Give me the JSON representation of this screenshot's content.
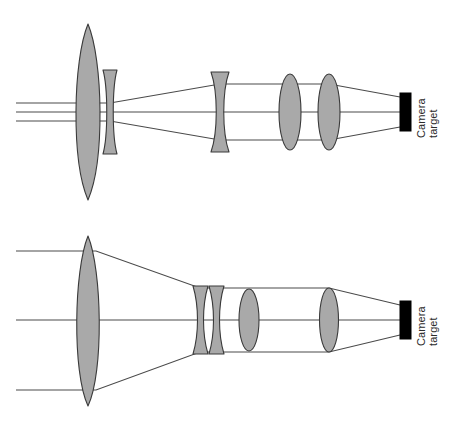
{
  "figure": {
    "background_color": "#ffffff",
    "lens_fill_color": "#a9a9a9",
    "lens_stroke_color": "#3a3a3a",
    "ray_color": "#4a4a4a",
    "sensor_color": "#000000",
    "width": 469,
    "height": 430
  },
  "panels": [
    {
      "id": "top-panel",
      "name": "upper-optical-system",
      "sensor_label_line1": "Camera",
      "sensor_label_line2": "target",
      "axis_y": 112,
      "elements": [
        {
          "name": "objective-lens",
          "type": "biconvex",
          "cx": 88,
          "half_height": 88,
          "thickness": 34
        },
        {
          "name": "field-lens-1",
          "type": "biconcave",
          "cx": 110,
          "half_height": 42,
          "thickness": 13
        },
        {
          "name": "field-lens-2",
          "type": "biconcave",
          "cx": 220,
          "half_height": 40,
          "thickness": 16
        },
        {
          "name": "relay-lens-1",
          "type": "biconvex",
          "cx": 290,
          "half_height": 38,
          "thickness": 20
        },
        {
          "name": "relay-lens-2",
          "type": "biconvex",
          "cx": 329,
          "half_height": 38,
          "thickness": 20
        },
        {
          "name": "camera-target",
          "type": "sensor",
          "x": 400,
          "y": 93,
          "width": 11,
          "height": 38
        }
      ],
      "rays": [
        {
          "name": "ray-upper",
          "points": "16,103 110,103 220,84 290,84 329,84 400,97"
        },
        {
          "name": "ray-axial",
          "points": "16,112 400,112"
        },
        {
          "name": "ray-lower",
          "points": "16,121 110,121 220,140 290,140 329,140 400,127"
        }
      ]
    },
    {
      "id": "bottom-panel",
      "name": "lower-optical-system",
      "sensor_label_line1": "Camera",
      "sensor_label_line2": "target",
      "axis_y": 320,
      "elements": [
        {
          "name": "objective-lens",
          "type": "biconvex",
          "cx": 88,
          "half_height": 85,
          "thickness": 30
        },
        {
          "name": "diverging-lens-1",
          "type": "biconcave",
          "cx": 200,
          "half_height": 34,
          "thickness": 14
        },
        {
          "name": "diverging-lens-2",
          "type": "biconcave",
          "cx": 216,
          "half_height": 34,
          "thickness": 14
        },
        {
          "name": "relay-lens-1",
          "type": "biconvex",
          "cx": 249,
          "half_height": 31,
          "thickness": 18
        },
        {
          "name": "relay-lens-2",
          "type": "biconvex",
          "cx": 329,
          "half_height": 32,
          "thickness": 18
        },
        {
          "name": "camera-target",
          "type": "sensor",
          "x": 400,
          "y": 301,
          "width": 11,
          "height": 38
        }
      ],
      "rays": [
        {
          "name": "ray-upper",
          "points": "16,251 96,251 200,288 249,288 329,288 400,305"
        },
        {
          "name": "ray-axial",
          "points": "16,320 400,320"
        },
        {
          "name": "ray-lower",
          "points": "16,390 96,390 200,352 249,352 329,352 400,335"
        }
      ]
    }
  ]
}
